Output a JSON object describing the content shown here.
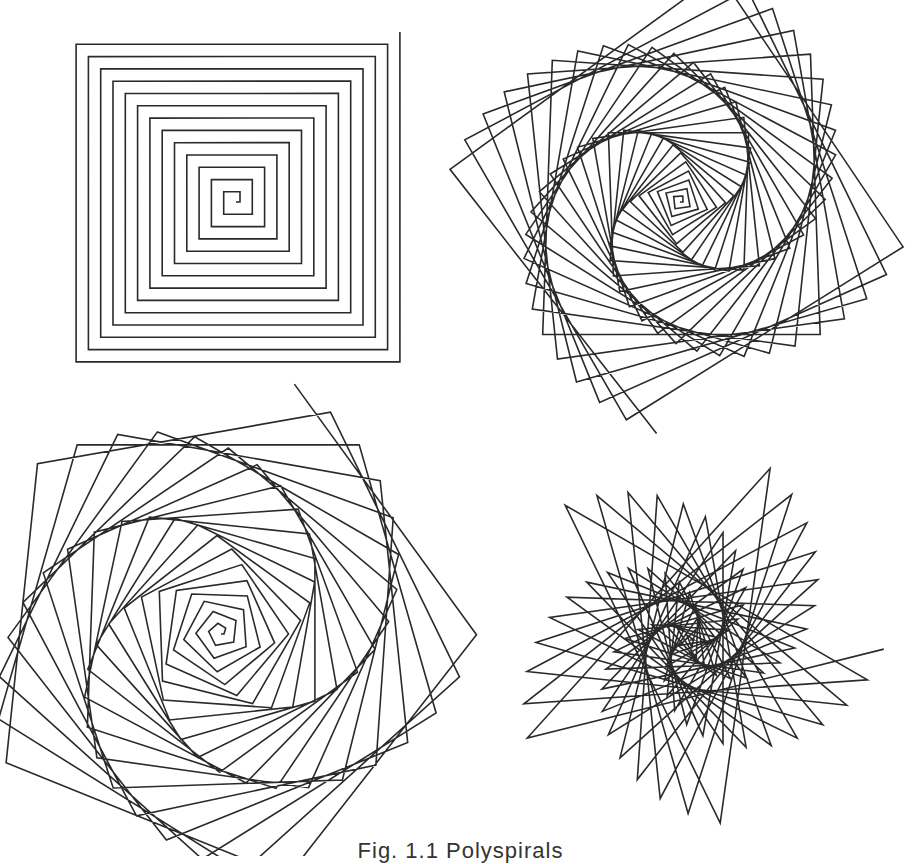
{
  "figure": {
    "caption": "Fig. 1.1  Polyspirals",
    "ink_color": "#2a2a2a",
    "panels": [
      {
        "name": "square-spiral",
        "position": "top-left",
        "angle_deg": 90,
        "step_start": 4,
        "step_increment": 6.15,
        "segments": 54,
        "start_x": 236,
        "start_y": 202,
        "start_heading_deg": 0
      },
      {
        "name": "twisted-square-spiral",
        "position": "top-right",
        "angle_deg": 92,
        "step_start": 3,
        "step_increment": 3.05,
        "segments": 110,
        "start_x": 680,
        "start_y": 202,
        "start_heading_deg": 0
      },
      {
        "name": "pentagon-spiral",
        "position": "bottom-left",
        "angle_deg": 74,
        "step_start": 3,
        "step_increment": 3.1,
        "segments": 100,
        "start_x": 221,
        "start_y": 634,
        "start_heading_deg": 0
      },
      {
        "name": "star-spiral",
        "position": "bottom-right",
        "angle_deg": 146,
        "step_start": 4,
        "step_increment": 4.6,
        "segments": 80,
        "start_x": 690,
        "start_y": 640,
        "start_heading_deg": 0
      }
    ]
  }
}
